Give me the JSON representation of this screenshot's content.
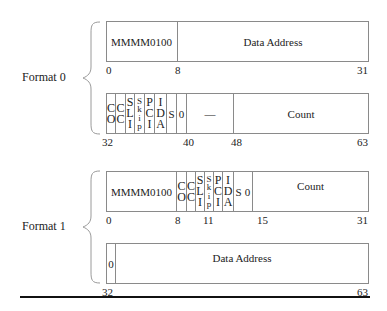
{
  "formats": [
    {
      "label": "Format 0",
      "word0": {
        "fields": [
          {
            "text": "MMMM0100"
          },
          {
            "text": "Data Address"
          }
        ],
        "ticks": [
          "0",
          "8",
          "31"
        ]
      },
      "word1": {
        "fields": [
          {
            "lines": [
              "C",
              "O"
            ]
          },
          {
            "lines": [
              "C",
              "C"
            ]
          },
          {
            "lines": [
              "S",
              "L",
              "I"
            ]
          },
          {
            "lines": [
              "S",
              "k",
              "i",
              "p"
            ]
          },
          {
            "lines": [
              "P",
              "C",
              "I"
            ]
          },
          {
            "lines": [
              "I",
              "D",
              "A"
            ]
          },
          {
            "text": "S"
          },
          {
            "text": "0"
          },
          {
            "text": "—"
          },
          {
            "text": "Count"
          }
        ],
        "ticks": [
          "32",
          "40",
          "48",
          "63"
        ]
      }
    },
    {
      "label": "Format 1",
      "word0": {
        "fields": [
          {
            "text": "MMMM0100"
          },
          {
            "lines": [
              "C",
              "O"
            ]
          },
          {
            "lines": [
              "C",
              "C"
            ]
          },
          {
            "lines": [
              "S",
              "L",
              "I"
            ]
          },
          {
            "lines": [
              "S",
              "k",
              "i",
              "p"
            ]
          },
          {
            "lines": [
              "P",
              "C",
              "I"
            ]
          },
          {
            "lines": [
              "I",
              "D",
              "A"
            ]
          },
          {
            "text": "S"
          },
          {
            "text": "0"
          },
          {
            "text": "Count"
          }
        ],
        "ticks": [
          "0",
          "8",
          "11",
          "15",
          "31"
        ]
      },
      "word1": {
        "fields": [
          {
            "text": "0"
          },
          {
            "text": "Data Address"
          }
        ],
        "ticks": [
          "32",
          "63"
        ]
      }
    }
  ]
}
